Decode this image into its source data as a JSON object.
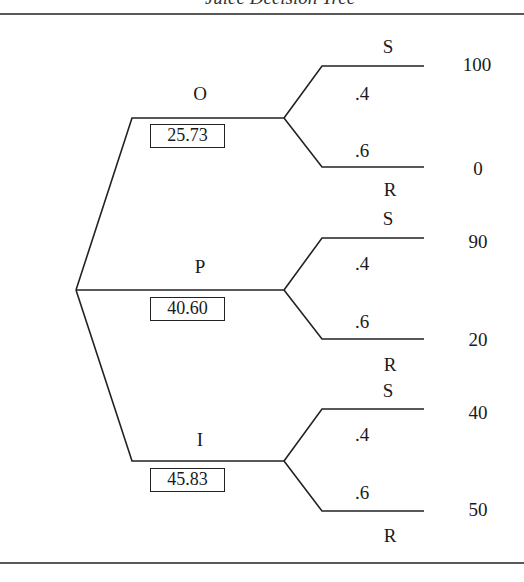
{
  "title": "Juice Decision Tree",
  "colors": {
    "line": "#222222",
    "text": "#1a1a1a",
    "background": "#ffffff"
  },
  "tree": {
    "decision_node": "root",
    "branches": [
      {
        "label": "O",
        "expected_value": "25.73",
        "outcomes": [
          {
            "state": "S",
            "probability": ".4",
            "payoff": "100"
          },
          {
            "state": "R",
            "probability": ".6",
            "payoff": "0"
          }
        ]
      },
      {
        "label": "P",
        "expected_value": "40.60",
        "outcomes": [
          {
            "state": "S",
            "probability": ".4",
            "payoff": "90"
          },
          {
            "state": "R",
            "probability": ".6",
            "payoff": "20"
          }
        ]
      },
      {
        "label": "I",
        "expected_value": "45.83",
        "outcomes": [
          {
            "state": "S",
            "probability": ".4",
            "payoff": "40"
          },
          {
            "state": "R",
            "probability": ".6",
            "payoff": "50"
          }
        ]
      }
    ]
  }
}
